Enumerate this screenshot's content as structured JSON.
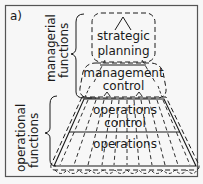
{
  "panel_label": "a)",
  "groups": {
    "managerial": {
      "line1": "managerial",
      "line2": "functions"
    },
    "operational": {
      "line1": "operational",
      "line2": "functions"
    }
  },
  "levels": {
    "strategic": {
      "line1": "strategic",
      "line2": "planning"
    },
    "management": {
      "line1": "management",
      "line2": "control"
    },
    "operations_control": {
      "line1": "operations",
      "line2": "control"
    },
    "operations": {
      "line1": "operations"
    }
  },
  "colors": {
    "ink": "#1a1a1a",
    "background": "#f7f7f7"
  }
}
